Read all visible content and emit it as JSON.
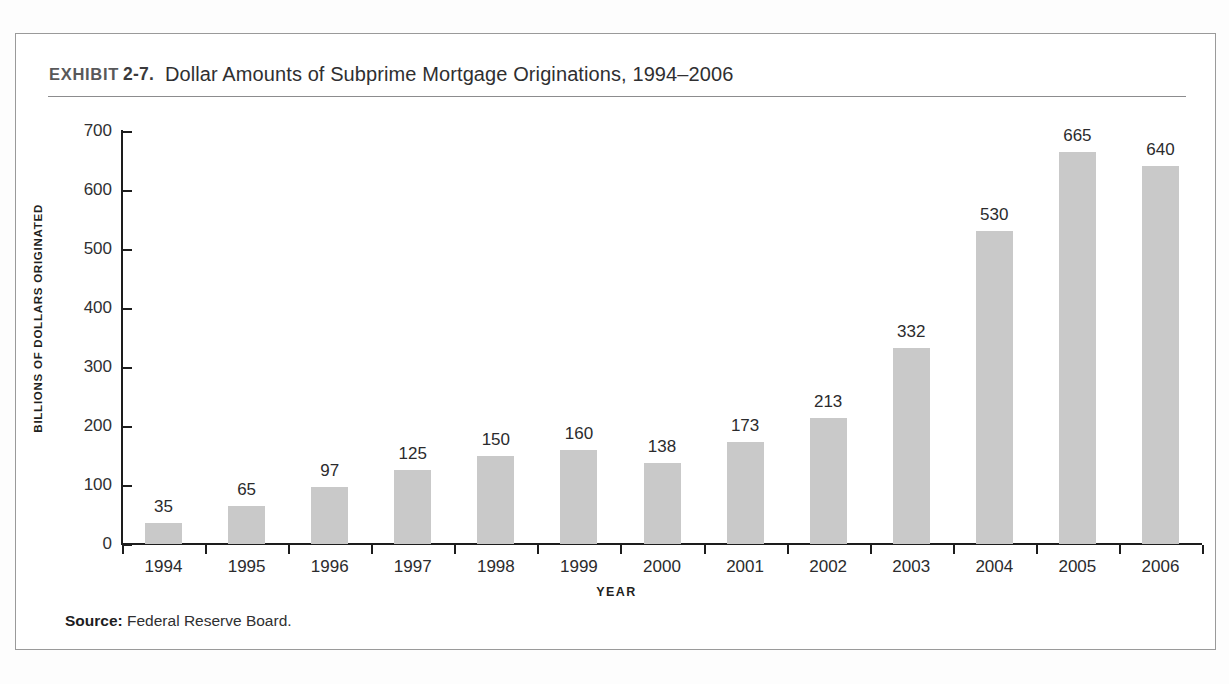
{
  "exhibit": {
    "kicker": "EXHIBIT",
    "number": "2-7.",
    "title": "Dollar Amounts of Subprime Mortgage Originations, 1994–2006"
  },
  "source": {
    "label": "Source:",
    "text": " Federal Reserve Board."
  },
  "colors": {
    "bar_fill": "#c9c9c9",
    "axis": "#1d1d1d",
    "frame": "#9a9a9a",
    "text": "#2b2b2d"
  },
  "chart_data": {
    "type": "bar",
    "title": "Dollar Amounts of Subprime Mortgage Originations, 1994–2006",
    "xlabel": "YEAR",
    "ylabel": "BILLIONS OF DOLLARS ORIGINATED",
    "categories": [
      "1994",
      "1995",
      "1996",
      "1997",
      "1998",
      "1999",
      "2000",
      "2001",
      "2002",
      "2003",
      "2004",
      "2005",
      "2006"
    ],
    "values": [
      35,
      65,
      97,
      125,
      150,
      160,
      138,
      173,
      213,
      332,
      530,
      665,
      640
    ],
    "value_labels": [
      "35",
      "65",
      "97",
      "125",
      "150",
      "160",
      "138",
      "173",
      "213",
      "332",
      "530",
      "665",
      "640"
    ],
    "ylim": [
      0,
      700
    ],
    "yticks": [
      0,
      100,
      200,
      300,
      400,
      500,
      600,
      700
    ],
    "ytick_labels": [
      "0",
      "100",
      "200",
      "300",
      "400",
      "500",
      "600",
      "700"
    ],
    "grid": false,
    "legend": null,
    "source": "Federal Reserve Board."
  }
}
